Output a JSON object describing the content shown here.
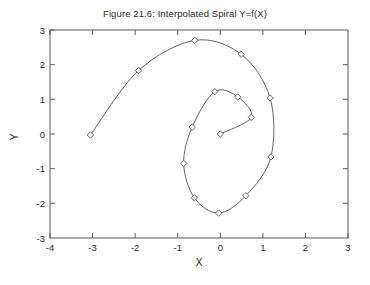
{
  "figure": {
    "title": "Figure 21.6: Interpolated Spiral Y=f(X)",
    "xlabel": "X",
    "ylabel": "Y"
  },
  "chart_data": {
    "type": "line",
    "title": "Figure 21.6: Interpolated Spiral Y=f(X)",
    "xlabel": "X",
    "ylabel": "Y",
    "xlim": [
      -4,
      3
    ],
    "ylim": [
      -3,
      3
    ],
    "xticks": [
      -4,
      -3,
      -2,
      -1,
      0,
      1,
      2,
      3
    ],
    "xticklabels": [
      "-4",
      "-3",
      "-2",
      "-1",
      "0",
      "1",
      "2",
      "3"
    ],
    "yticks": [
      -3,
      -2,
      -1,
      0,
      1,
      2,
      3
    ],
    "yticklabels": [
      "-3",
      "-2",
      "-1",
      "0",
      "1",
      "2",
      "3"
    ],
    "grid": false,
    "legend": false,
    "marker": "diamond",
    "line_color": "#555555",
    "marker_color": "#555555",
    "interpolation": "spline",
    "series": [
      {
        "name": "Interpolated Spiral",
        "x": [
          -3.05,
          -1.92,
          -0.6,
          0.49,
          1.17,
          1.19,
          0.6,
          -0.04,
          -0.61,
          -0.86,
          -0.66,
          -0.13,
          0.41,
          0.73,
          0.0
        ],
        "y": [
          -0.03,
          1.83,
          2.7,
          2.3,
          1.04,
          -0.66,
          -1.78,
          -2.28,
          -1.84,
          -0.85,
          0.2,
          1.22,
          1.07,
          0.48,
          0.0
        ]
      }
    ]
  }
}
